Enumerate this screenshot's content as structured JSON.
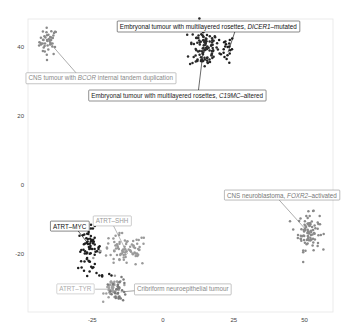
{
  "chart_data": {
    "type": "scatter",
    "title": "",
    "xlabel": "",
    "ylabel": "",
    "xlim": [
      -48,
      60
    ],
    "ylim": [
      -37,
      48
    ],
    "grid": false,
    "x_ticks": [
      -25,
      0,
      25,
      50
    ],
    "y_ticks": [
      40,
      20,
      0,
      -20
    ],
    "legend": "none (direct labels)",
    "series": [
      {
        "name": "CNS tumour with BCOR internal tandem duplication",
        "color": "#8a8a8a",
        "label_color": "#888888",
        "center": [
          -40.5,
          41.5
        ],
        "spread": [
          1.6,
          2.0
        ],
        "n": 45,
        "label_pos": [
          -22,
          31
        ],
        "label_text_parts": [
          [
            "CNS tumour with ",
            false
          ],
          [
            "BCOR",
            true
          ],
          [
            " internal tandem duplication",
            false
          ]
        ]
      },
      {
        "name": "Embryonal tumour with multilayered rosettes, DICER1-mutated",
        "color": "#1a1a1a",
        "label_color": "#111111",
        "center": [
          22.5,
          39.5
        ],
        "spread": [
          1.3,
          2.0
        ],
        "n": 20,
        "label_pos": [
          16,
          46
        ],
        "label_text_parts": [
          [
            "Embryonal tumour with multilayered rosettes, ",
            false
          ],
          [
            "DICER1",
            true
          ],
          [
            "–mutated",
            false
          ]
        ]
      },
      {
        "name": "Embryonal tumour with multilayered rosettes, C19MC-altered",
        "color": "#2a2a2a",
        "label_color": "#222222",
        "center": [
          14.5,
          40.0
        ],
        "spread": [
          2.6,
          3.3
        ],
        "n": 110,
        "label_pos": [
          5,
          26
        ],
        "label_text_parts": [
          [
            "Embryonal tumour with multilayered rosettes, ",
            false
          ],
          [
            "C19MC",
            true
          ],
          [
            "–altered",
            false
          ]
        ]
      },
      {
        "name": "CNS neuroblastoma, FOXR2-activated",
        "color": "#8a8a8a",
        "label_color": "#777777",
        "center": [
          51.5,
          -13.5
        ],
        "spread": [
          1.9,
          2.6
        ],
        "n": 90,
        "label_pos": [
          42,
          -3
        ],
        "label_text_parts": [
          [
            "CNS neuroblastoma, ",
            false
          ],
          [
            "FOXR2",
            true
          ],
          [
            "–activated",
            false
          ]
        ]
      },
      {
        "name": "ATRT-MYC",
        "color": "#1e1e1e",
        "label_color": "#111111",
        "center": [
          -26.0,
          -18.5
        ],
        "spread": [
          2.0,
          3.0
        ],
        "n": 70,
        "label_pos": [
          -33,
          -12
        ],
        "label_text_parts": [
          [
            "ATRT–MYC",
            false
          ]
        ]
      },
      {
        "name": "ATRT-SHH",
        "color": "#9a9a9a",
        "label_color": "#999999",
        "center": [
          -13.5,
          -19.0
        ],
        "spread": [
          4.2,
          2.4
        ],
        "n": 85,
        "label_pos": [
          -18,
          -10.5
        ],
        "label_text_parts": [
          [
            "ATRT–SHH",
            false
          ]
        ]
      },
      {
        "name": "ATRT-TYR",
        "color": "#a0a0a0",
        "label_color": "#aaaaaa",
        "center": [
          -17.5,
          -30.0
        ],
        "spread": [
          1.6,
          1.5
        ],
        "n": 45,
        "label_pos": [
          -31,
          -30.2
        ],
        "label_text_parts": [
          [
            "ATRT–TYR",
            false
          ]
        ]
      },
      {
        "name": "Cribriform neuroepithelial tumour",
        "color": "#7a7a7a",
        "label_color": "#888888",
        "center": [
          -15.5,
          -30.5
        ],
        "spread": [
          1.4,
          1.6
        ],
        "n": 30,
        "label_pos": [
          7,
          -30.2
        ],
        "label_text_parts": [
          [
            "Cribriform neuroepithelial tumour",
            false
          ]
        ]
      }
    ],
    "extra_points": [
      {
        "series": "ATRT-MYC",
        "points": [
          [
            -23.5,
            -25.5
          ],
          [
            -22.5,
            -26.2
          ],
          [
            -21.5,
            -26.5
          ],
          [
            -19,
            -25.8
          ],
          [
            -18.2,
            -26.2
          ]
        ]
      }
    ],
    "leader_lines": [
      {
        "from": [
          -40.0,
          41.2
        ],
        "to": [
          -30.5,
          32.3
        ]
      },
      {
        "from": [
          23.0,
          38.5
        ],
        "to": [
          25.5,
          44.7
        ]
      },
      {
        "from": [
          14.0,
          37.5
        ],
        "to": [
          12.5,
          27.3
        ]
      },
      {
        "from": [
          50.0,
          -12.5
        ],
        "to": [
          41.0,
          -4.3
        ]
      },
      {
        "from": [
          -26.0,
          -17.5
        ],
        "to": [
          -30.0,
          -13.3
        ]
      },
      {
        "from": [
          -12.5,
          -20.0
        ],
        "to": [
          -17.5,
          -11.8
        ]
      },
      {
        "from": [
          -18.0,
          -30.2
        ],
        "to": [
          -24.0,
          -30.2
        ]
      },
      {
        "from": [
          -15.0,
          -31.0
        ],
        "to": [
          -3.5,
          -30.2
        ]
      }
    ]
  }
}
